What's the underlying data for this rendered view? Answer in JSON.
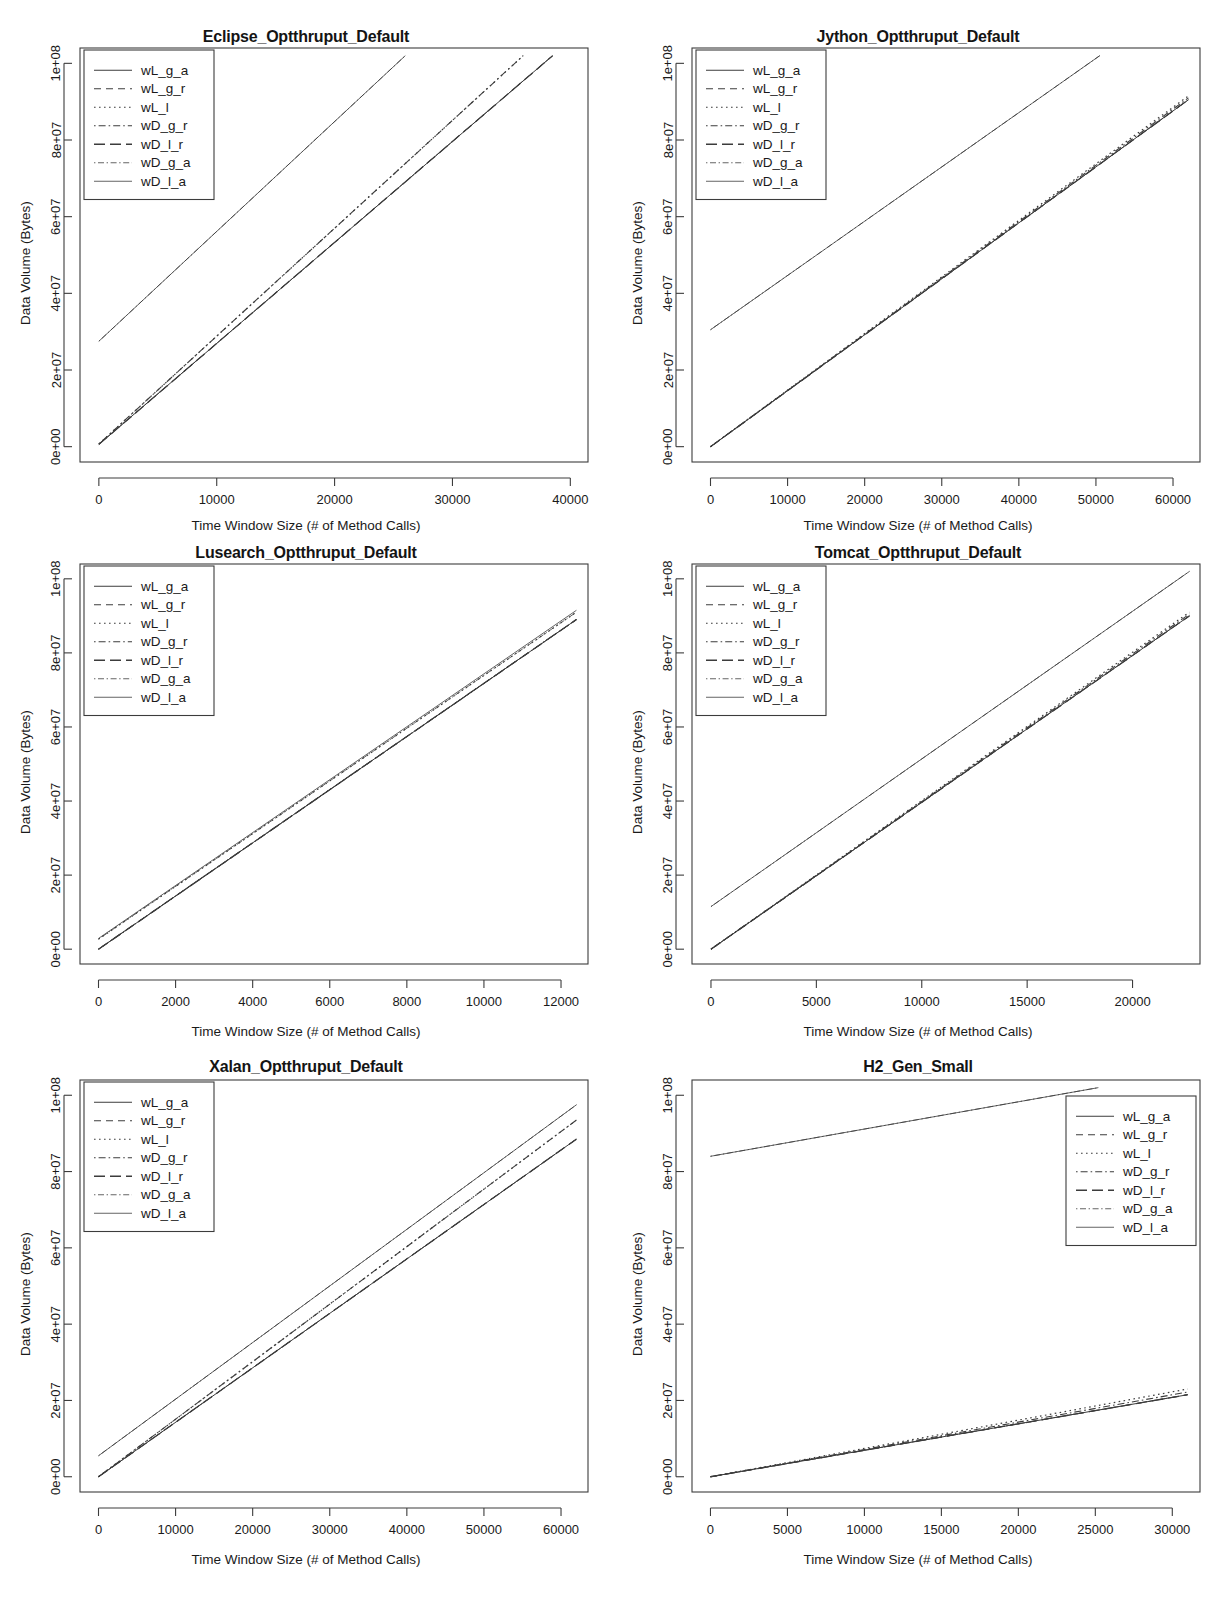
{
  "figure": {
    "axis_x_label": "Time Window Size (# of Method Calls)",
    "axis_y_label": "Data Volume (Bytes)",
    "legend_labels": [
      "wL_g_a",
      "wL_g_r",
      "wL_l",
      "wD_g_r",
      "wD_l_r",
      "wD_g_a",
      "wD_l_a"
    ],
    "y_tick_labels": [
      "0e+00",
      "2e+07",
      "4e+07",
      "6e+07",
      "8e+07",
      "1e+08"
    ],
    "line_color": "#3c3c3c"
  },
  "chart_data": [
    {
      "type": "line",
      "title": "Eclipse_Optthruput_Default",
      "xlabel": "Time Window Size (# of Method Calls)",
      "ylabel": "Data Volume (Bytes)",
      "xlim": [
        -1600,
        41500
      ],
      "ylim": [
        -4000000,
        104000000
      ],
      "xticks": [
        0,
        10000,
        20000,
        30000,
        40000
      ],
      "xtick_labels": [
        "0",
        "10000",
        "20000",
        "30000",
        "40000"
      ],
      "yticks": [
        0,
        20000000,
        40000000,
        60000000,
        80000000,
        100000000
      ],
      "ytick_labels": [
        "0e+00",
        "2e+07",
        "4e+07",
        "6e+07",
        "8e+07",
        "1e+08"
      ],
      "grid": false,
      "legend_position": "top-left",
      "series": [
        {
          "name": "wL_g_a",
          "dash": "solid",
          "x": [
            0,
            38500
          ],
          "y": [
            600000,
            102000000
          ]
        },
        {
          "name": "wL_g_r",
          "dash": "dashed",
          "x": [
            0,
            38500
          ],
          "y": [
            600000,
            102000000
          ]
        },
        {
          "name": "wL_l",
          "dash": "dotted",
          "x": [
            0,
            36000
          ],
          "y": [
            700000,
            102000000
          ]
        },
        {
          "name": "wD_g_r",
          "dash": "dashdot",
          "x": [
            0,
            36000
          ],
          "y": [
            700000,
            102000000
          ]
        },
        {
          "name": "wD_l_r",
          "dash": "longdash",
          "x": [
            0,
            38500
          ],
          "y": [
            600000,
            102000000
          ]
        },
        {
          "name": "wD_g_a",
          "dash": "thindashdot",
          "x": [
            0,
            26000
          ],
          "y": [
            27500000,
            102000000
          ]
        },
        {
          "name": "wD_l_a",
          "dash": "thinsolid",
          "x": [
            0,
            26000
          ],
          "y": [
            27500000,
            102000000
          ]
        }
      ]
    },
    {
      "type": "line",
      "title": "Jython_Optthruput_Default",
      "xlabel": "Time Window Size (# of Method Calls)",
      "ylabel": "Data Volume (Bytes)",
      "xlim": [
        -2400,
        63500
      ],
      "ylim": [
        -4000000,
        104000000
      ],
      "xticks": [
        0,
        10000,
        20000,
        30000,
        40000,
        50000,
        60000
      ],
      "xtick_labels": [
        "0",
        "10000",
        "20000",
        "30000",
        "40000",
        "50000",
        "60000"
      ],
      "yticks": [
        0,
        20000000,
        40000000,
        60000000,
        80000000,
        100000000
      ],
      "ytick_labels": [
        "0e+00",
        "2e+07",
        "4e+07",
        "6e+07",
        "8e+07",
        "1e+08"
      ],
      "grid": false,
      "legend_position": "top-left",
      "series": [
        {
          "name": "wL_g_a",
          "dash": "solid",
          "x": [
            0,
            62000
          ],
          "y": [
            0,
            90500000
          ]
        },
        {
          "name": "wL_g_r",
          "dash": "dashed",
          "x": [
            0,
            62000
          ],
          "y": [
            0,
            90500000
          ]
        },
        {
          "name": "wL_l",
          "dash": "dotted",
          "x": [
            0,
            62000
          ],
          "y": [
            0,
            91500000
          ]
        },
        {
          "name": "wD_g_r",
          "dash": "dashdot",
          "x": [
            0,
            62000
          ],
          "y": [
            0,
            91000000
          ]
        },
        {
          "name": "wD_l_r",
          "dash": "longdash",
          "x": [
            0,
            62000
          ],
          "y": [
            0,
            90500000
          ]
        },
        {
          "name": "wD_g_a",
          "dash": "thindashdot",
          "x": [
            0,
            50500
          ],
          "y": [
            30500000,
            102000000
          ]
        },
        {
          "name": "wD_l_a",
          "dash": "thinsolid",
          "x": [
            0,
            50500
          ],
          "y": [
            30500000,
            102000000
          ]
        }
      ]
    },
    {
      "type": "line",
      "title": "Lusearch_Optthruput_Default",
      "xlabel": "Time Window Size (# of Method Calls)",
      "ylabel": "Data Volume (Bytes)",
      "xlim": [
        -480,
        12700
      ],
      "ylim": [
        -4000000,
        104000000
      ],
      "xticks": [
        0,
        2000,
        4000,
        6000,
        8000,
        10000,
        12000
      ],
      "xtick_labels": [
        "0",
        "2000",
        "4000",
        "6000",
        "8000",
        "10000",
        "12000"
      ],
      "yticks": [
        0,
        20000000,
        40000000,
        60000000,
        80000000,
        100000000
      ],
      "ytick_labels": [
        "0e+00",
        "2e+07",
        "4e+07",
        "6e+07",
        "8e+07",
        "1e+08"
      ],
      "grid": false,
      "legend_position": "top-left",
      "series": [
        {
          "name": "wL_g_a",
          "dash": "solid",
          "x": [
            0,
            12400
          ],
          "y": [
            0,
            89000000
          ]
        },
        {
          "name": "wL_g_r",
          "dash": "dashed",
          "x": [
            0,
            12400
          ],
          "y": [
            0,
            89000000
          ]
        },
        {
          "name": "wL_l",
          "dash": "dotted",
          "x": [
            0,
            12400
          ],
          "y": [
            2700000,
            91000000
          ]
        },
        {
          "name": "wD_g_r",
          "dash": "dashdot",
          "x": [
            0,
            12400
          ],
          "y": [
            0,
            89000000
          ]
        },
        {
          "name": "wD_l_r",
          "dash": "longdash",
          "x": [
            0,
            12400
          ],
          "y": [
            0,
            89000000
          ]
        },
        {
          "name": "wD_g_a",
          "dash": "thindashdot",
          "x": [
            0,
            12400
          ],
          "y": [
            2700000,
            91000000
          ]
        },
        {
          "name": "wD_l_a",
          "dash": "thinsolid",
          "x": [
            0,
            12400
          ],
          "y": [
            2900000,
            91500000
          ]
        }
      ]
    },
    {
      "type": "line",
      "title": "Tomcat_Optthruput_Default",
      "xlabel": "Time Window Size (# of Method Calls)",
      "ylabel": "Data Volume (Bytes)",
      "xlim": [
        -900,
        23200
      ],
      "ylim": [
        -4000000,
        104000000
      ],
      "xticks": [
        0,
        5000,
        10000,
        15000,
        20000
      ],
      "xtick_labels": [
        "0",
        "5000",
        "10000",
        "15000",
        "20000"
      ],
      "yticks": [
        0,
        20000000,
        40000000,
        60000000,
        80000000,
        100000000
      ],
      "ytick_labels": [
        "0e+00",
        "2e+07",
        "4e+07",
        "6e+07",
        "8e+07",
        "1e+08"
      ],
      "grid": false,
      "legend_position": "top-left",
      "series": [
        {
          "name": "wL_g_a",
          "dash": "solid",
          "x": [
            0,
            22700
          ],
          "y": [
            0,
            90000000
          ]
        },
        {
          "name": "wL_g_r",
          "dash": "dashed",
          "x": [
            0,
            22700
          ],
          "y": [
            0,
            90000000
          ]
        },
        {
          "name": "wL_l",
          "dash": "dotted",
          "x": [
            0,
            22700
          ],
          "y": [
            0,
            91000000
          ]
        },
        {
          "name": "wD_g_r",
          "dash": "dashdot",
          "x": [
            0,
            22700
          ],
          "y": [
            0,
            90500000
          ]
        },
        {
          "name": "wD_l_r",
          "dash": "longdash",
          "x": [
            0,
            22700
          ],
          "y": [
            0,
            90000000
          ]
        },
        {
          "name": "wD_g_a",
          "dash": "thindashdot",
          "x": [
            0,
            22700
          ],
          "y": [
            11500000,
            102000000
          ]
        },
        {
          "name": "wD_l_a",
          "dash": "thinsolid",
          "x": [
            0,
            22700
          ],
          "y": [
            11500000,
            102000000
          ]
        }
      ]
    },
    {
      "type": "line",
      "title": "Xalan_Optthruput_Default",
      "xlabel": "Time Window Size (# of Method Calls)",
      "ylabel": "Data Volume (Bytes)",
      "xlim": [
        -2400,
        63500
      ],
      "ylim": [
        -4000000,
        104000000
      ],
      "xticks": [
        0,
        10000,
        20000,
        30000,
        40000,
        50000,
        60000
      ],
      "xtick_labels": [
        "0",
        "10000",
        "20000",
        "30000",
        "40000",
        "50000",
        "60000"
      ],
      "yticks": [
        0,
        20000000,
        40000000,
        60000000,
        80000000,
        100000000
      ],
      "ytick_labels": [
        "0e+00",
        "2e+07",
        "4e+07",
        "6e+07",
        "8e+07",
        "1e+08"
      ],
      "grid": false,
      "legend_position": "top-left",
      "series": [
        {
          "name": "wL_g_a",
          "dash": "solid",
          "x": [
            0,
            62000
          ],
          "y": [
            0,
            88500000
          ]
        },
        {
          "name": "wL_g_r",
          "dash": "dashed",
          "x": [
            0,
            62000
          ],
          "y": [
            0,
            88500000
          ]
        },
        {
          "name": "wL_l",
          "dash": "dotted",
          "x": [
            0,
            62000
          ],
          "y": [
            0,
            93500000
          ]
        },
        {
          "name": "wD_g_r",
          "dash": "dashdot",
          "x": [
            0,
            62000
          ],
          "y": [
            0,
            93500000
          ]
        },
        {
          "name": "wD_l_r",
          "dash": "longdash",
          "x": [
            0,
            62000
          ],
          "y": [
            0,
            88500000
          ]
        },
        {
          "name": "wD_g_a",
          "dash": "thindashdot",
          "x": [
            0,
            62000
          ],
          "y": [
            5500000,
            97500000
          ]
        },
        {
          "name": "wD_l_a",
          "dash": "thinsolid",
          "x": [
            0,
            62000
          ],
          "y": [
            5500000,
            97500000
          ]
        }
      ]
    },
    {
      "type": "line",
      "title": "H2_Gen_Small",
      "xlabel": "Time Window Size (# of Method Calls)",
      "ylabel": "Data Volume (Bytes)",
      "xlim": [
        -1200,
        31800
      ],
      "ylim": [
        -4000000,
        104000000
      ],
      "xticks": [
        0,
        5000,
        10000,
        15000,
        20000,
        25000,
        30000
      ],
      "xtick_labels": [
        "0",
        "5000",
        "10000",
        "15000",
        "20000",
        "25000",
        "30000"
      ],
      "yticks": [
        0,
        20000000,
        40000000,
        60000000,
        80000000,
        100000000
      ],
      "ytick_labels": [
        "0e+00",
        "2e+07",
        "4e+07",
        "6e+07",
        "8e+07",
        "1e+08"
      ],
      "grid": false,
      "legend_position": "top-right",
      "series": [
        {
          "name": "wL_g_a",
          "dash": "solid",
          "x": [
            0,
            31000
          ],
          "y": [
            0,
            21500000
          ]
        },
        {
          "name": "wL_g_r",
          "dash": "dashed",
          "x": [
            0,
            31000
          ],
          "y": [
            0,
            21500000
          ]
        },
        {
          "name": "wL_l",
          "dash": "dotted",
          "x": [
            0,
            31000
          ],
          "y": [
            0,
            23000000
          ]
        },
        {
          "name": "wD_g_r",
          "dash": "dashdot",
          "x": [
            0,
            31000
          ],
          "y": [
            0,
            22200000
          ]
        },
        {
          "name": "wD_l_r",
          "dash": "longdash",
          "x": [
            0,
            31000
          ],
          "y": [
            0,
            21500000
          ]
        },
        {
          "name": "wD_g_a",
          "dash": "thindashdot",
          "x": [
            0,
            25200
          ],
          "y": [
            84000000,
            102000000
          ]
        },
        {
          "name": "wD_l_a",
          "dash": "thinsolid",
          "x": [
            0,
            25200
          ],
          "y": [
            84000000,
            102000000
          ]
        }
      ]
    }
  ]
}
